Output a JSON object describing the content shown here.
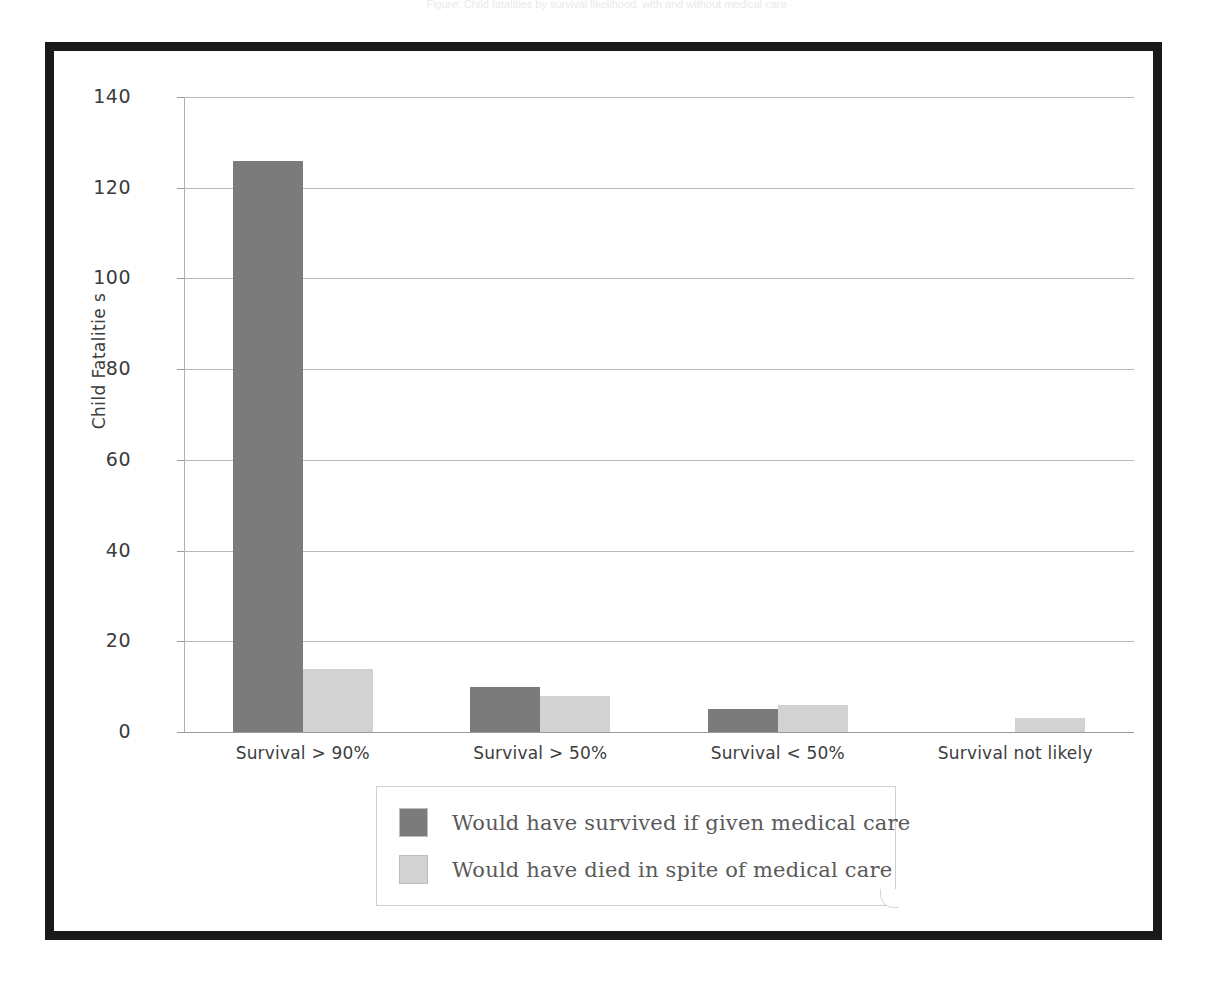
{
  "page": {
    "top_caption": "Figure: Child fatalities by survival likelihood, with and without medical care"
  },
  "chart_data": {
    "type": "bar",
    "title": "",
    "xlabel": "",
    "ylabel": "Child Fatalitie s",
    "categories": [
      "Survival > 90%",
      "Survival > 50%",
      "Survival < 50%",
      "Survival not likely"
    ],
    "series": [
      {
        "name": "Would have survived if given medical care",
        "color": "#7b7b7b",
        "values": [
          126,
          10,
          5,
          0
        ]
      },
      {
        "name": "Would have died in spite of medical care",
        "color": "#d2d2d2",
        "values": [
          14,
          8,
          6,
          3
        ]
      }
    ],
    "ylim": [
      0,
      140
    ],
    "yticks": [
      0,
      20,
      40,
      60,
      80,
      100,
      120,
      140
    ],
    "ytick_labels": [
      "0",
      "20",
      "40",
      "60",
      "80",
      "100",
      "120",
      "140"
    ],
    "grid": true,
    "grid_axis": "y",
    "legend_position": "bottom-center",
    "frame": "thick-black-border"
  }
}
